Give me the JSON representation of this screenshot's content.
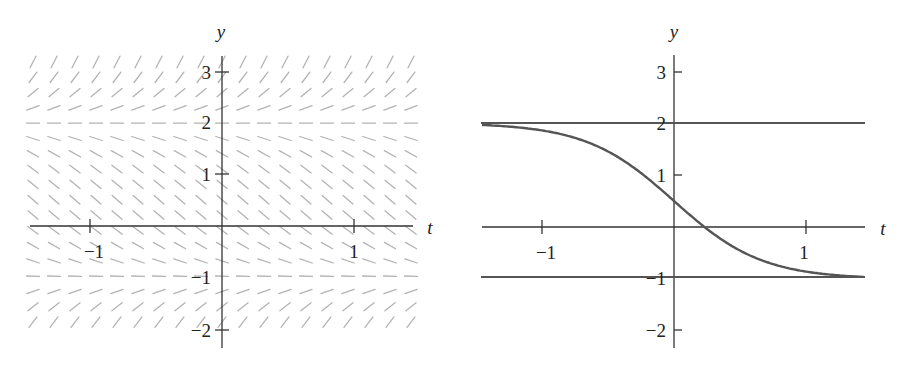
{
  "chart_data": [
    {
      "type": "slope_field",
      "title": "",
      "equation": "dy/dt = (y - 2)(y + 1)",
      "xlabel": "t",
      "ylabel": "y",
      "xlim": [
        -1.45,
        1.45
      ],
      "ylim": [
        -2.35,
        3.3
      ],
      "x_ticks": [
        -1,
        1
      ],
      "x_tick_labels": [
        "−1",
        "1"
      ],
      "y_ticks": [
        -2,
        -1,
        1,
        2,
        3
      ],
      "y_tick_labels": [
        "−2",
        "−1",
        "1",
        "2",
        "3"
      ],
      "grid": false,
      "slope_color": "#b3b3b3",
      "field_columns": 19,
      "field_rows": 19
    },
    {
      "type": "line",
      "title": "",
      "xlabel": "t",
      "ylabel": "y",
      "xlim": [
        -1.45,
        1.45
      ],
      "ylim": [
        -2.35,
        3.3
      ],
      "x_ticks": [
        -1,
        1
      ],
      "x_tick_labels": [
        "−1",
        "1"
      ],
      "y_ticks": [
        -2,
        -1,
        1,
        2,
        3
      ],
      "y_tick_labels": [
        "−2",
        "−1",
        "1",
        "2",
        "3"
      ],
      "grid": false,
      "series": [
        {
          "name": "equilibrium y=2",
          "x": [
            -1.45,
            1.45
          ],
          "y": [
            2,
            2
          ]
        },
        {
          "name": "equilibrium y=-1",
          "x": [
            -1.45,
            1.45
          ],
          "y": [
            -1,
            -1
          ]
        },
        {
          "name": "solution y(0)=0.5",
          "x": [
            -1.45,
            -1.0,
            -0.5,
            0,
            0.23,
            0.5,
            1.0,
            1.45
          ],
          "y": [
            1.98,
            1.86,
            1.47,
            0.5,
            0.0,
            -0.47,
            -0.86,
            -0.98
          ]
        }
      ],
      "line_color": "#555555"
    }
  ],
  "left": {
    "t_label": "t",
    "y_label": "y",
    "t_ticks": [
      "−1",
      "1"
    ],
    "y_ticks": [
      "3",
      "2",
      "1",
      "−1",
      "−2"
    ]
  },
  "right": {
    "t_label": "t",
    "y_label": "y",
    "t_ticks": [
      "−1",
      "1"
    ],
    "y_ticks": [
      "3",
      "2",
      "1",
      "−1",
      "−2"
    ]
  }
}
